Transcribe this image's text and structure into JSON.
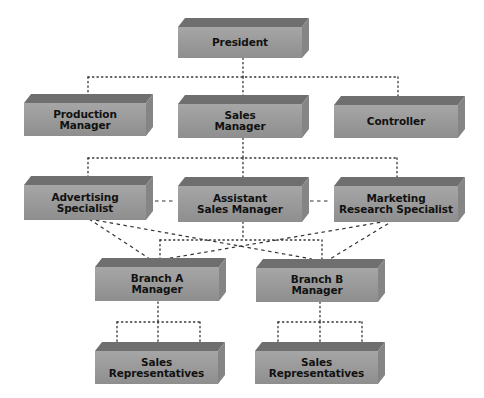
{
  "chart": {
    "colors": {
      "front": "#9b9b9b",
      "top": "#6f6f6f",
      "side": "#858585",
      "text": "#111111",
      "line": "#333333"
    },
    "nodes": [
      {
        "id": "president",
        "label": "President",
        "level": 1
      },
      {
        "id": "production-manager",
        "label": "Production Manager",
        "level": 2
      },
      {
        "id": "sales-manager",
        "label": "Sales Manager",
        "level": 2
      },
      {
        "id": "controller",
        "label": "Controller",
        "level": 2
      },
      {
        "id": "advertising-specialist",
        "label": "Advertising Specialist",
        "level": 3
      },
      {
        "id": "assistant-sales-manager",
        "label": "Assistant Sales Manager",
        "level": 3
      },
      {
        "id": "marketing-research-specialist",
        "label": "Marketing Research Specialist",
        "level": 3
      },
      {
        "id": "branch-a-manager",
        "label": "Branch A Manager",
        "level": 4
      },
      {
        "id": "branch-b-manager",
        "label": "Branch B Manager",
        "level": 4
      },
      {
        "id": "sales-representatives-a",
        "label": "Sales Representatives",
        "level": 5
      },
      {
        "id": "sales-representatives-b",
        "label": "Sales Representatives",
        "level": 5
      }
    ],
    "labels": {
      "president": [
        "President"
      ],
      "production_manager": [
        "Production",
        "Manager"
      ],
      "sales_manager": [
        "Sales",
        "Manager"
      ],
      "controller": [
        "Controller"
      ],
      "advertising_specialist": [
        "Advertising",
        "Specialist"
      ],
      "assistant_sales_manager": [
        "Assistant",
        "Sales Manager"
      ],
      "marketing_research_specialist": [
        "Marketing",
        "Research Specialist"
      ],
      "branch_a_manager": [
        "Branch A",
        "Manager"
      ],
      "branch_b_manager": [
        "Branch B",
        "Manager"
      ],
      "sales_reps_a": [
        "Sales",
        "Representatives"
      ],
      "sales_reps_b": [
        "Sales",
        "Representatives"
      ]
    },
    "edges": [
      {
        "from": "president",
        "to": "production-manager",
        "style": "dotted"
      },
      {
        "from": "president",
        "to": "sales-manager",
        "style": "dotted"
      },
      {
        "from": "president",
        "to": "controller",
        "style": "dotted"
      },
      {
        "from": "sales-manager",
        "to": "advertising-specialist",
        "style": "dotted"
      },
      {
        "from": "sales-manager",
        "to": "assistant-sales-manager",
        "style": "dotted"
      },
      {
        "from": "sales-manager",
        "to": "marketing-research-specialist",
        "style": "dotted"
      },
      {
        "from": "advertising-specialist",
        "to": "assistant-sales-manager",
        "style": "dashed"
      },
      {
        "from": "assistant-sales-manager",
        "to": "marketing-research-specialist",
        "style": "dashed"
      },
      {
        "from": "assistant-sales-manager",
        "to": "branch-a-manager",
        "style": "dotted"
      },
      {
        "from": "assistant-sales-manager",
        "to": "branch-b-manager",
        "style": "dotted"
      },
      {
        "from": "advertising-specialist",
        "to": "branch-a-manager",
        "style": "dashed"
      },
      {
        "from": "advertising-specialist",
        "to": "branch-b-manager",
        "style": "dashed"
      },
      {
        "from": "marketing-research-specialist",
        "to": "branch-a-manager",
        "style": "dashed"
      },
      {
        "from": "marketing-research-specialist",
        "to": "branch-b-manager",
        "style": "dashed"
      },
      {
        "from": "branch-a-manager",
        "to": "sales-representatives-a",
        "style": "dotted"
      },
      {
        "from": "branch-b-manager",
        "to": "sales-representatives-b",
        "style": "dotted"
      }
    ]
  }
}
